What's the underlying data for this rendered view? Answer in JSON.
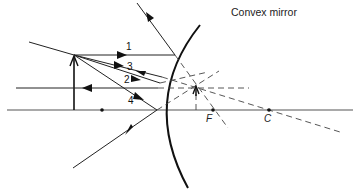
{
  "title": "Convex mirror",
  "ray_labels": [
    "1",
    "3",
    "2",
    "4"
  ],
  "points": {
    "focal": "F",
    "center": "C"
  },
  "colors": {
    "line": "#222222",
    "axis": "#555555",
    "background": "#ffffff"
  },
  "elements": {
    "object": "upright arrow (object)",
    "image": "virtual upright diminished image behind mirror",
    "mirror": "convex mirror arc",
    "principal_axis": "horizontal principal axis",
    "focal_point": "F",
    "center_of_curvature": "C"
  }
}
